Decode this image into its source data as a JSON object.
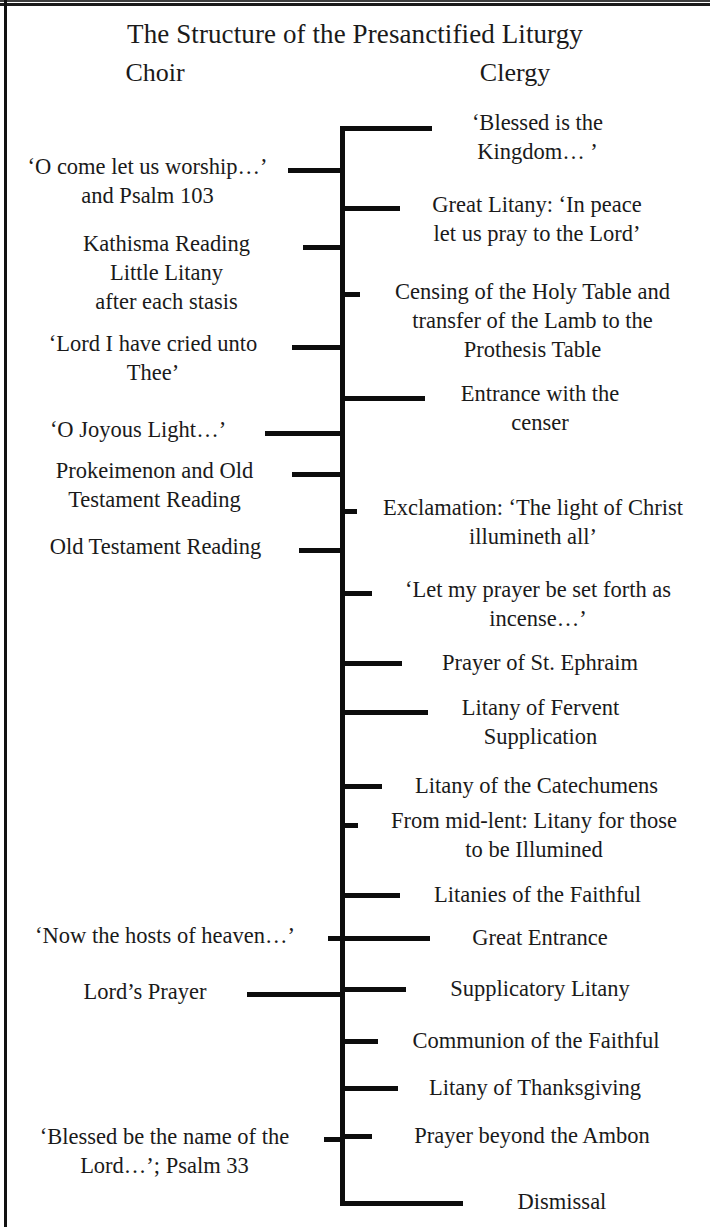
{
  "diagram": {
    "title": "The Structure of the Presanctified Liturgy",
    "columns": {
      "left_heading": "Choir",
      "right_heading": "Clergy"
    },
    "spine_color": "#0d0d0d",
    "background_color": "#ffffff",
    "text_color": "#1a1a1a"
  },
  "clergy_items": [
    {
      "text": "‘Blessed is the\nKingdom… ’"
    },
    {
      "text": "Great Litany: ‘In peace\nlet us pray to the Lord’"
    },
    {
      "text": "Censing of the Holy Table and\ntransfer of the Lamb to the\nProthesis Table"
    },
    {
      "text": "Entrance with the\ncenser"
    },
    {
      "text": "Exclamation: ‘The light of Christ\nillumineth all’"
    },
    {
      "text": "‘Let my prayer be set forth as\nincense…’"
    },
    {
      "text": "Prayer of St. Ephraim"
    },
    {
      "text": "Litany of Fervent\nSupplication"
    },
    {
      "text": "Litany of the Catechumens"
    },
    {
      "text": "From mid-lent: Litany for those\nto be Illumined"
    },
    {
      "text": "Litanies of the Faithful"
    },
    {
      "text": "Great Entrance"
    },
    {
      "text": "Supplicatory Litany"
    },
    {
      "text": "Communion of the Faithful"
    },
    {
      "text": "Litany of Thanksgiving"
    },
    {
      "text": "Prayer beyond the Ambon"
    },
    {
      "text": "Dismissal"
    }
  ],
  "choir_items": [
    {
      "text": "‘O come let us worship…’\nand Psalm 103"
    },
    {
      "text": "Kathisma Reading\nLittle Litany\nafter each stasis"
    },
    {
      "text": "‘Lord I have cried unto\nThee’"
    },
    {
      "text": "‘O Joyous Light…’"
    },
    {
      "text": "Prokeimenon and Old\nTestament Reading"
    },
    {
      "text": "Old Testament Reading"
    },
    {
      "text": "‘Now the hosts of heaven…’"
    },
    {
      "text": "Lord’s Prayer"
    },
    {
      "text": "‘Blessed be the name of the\nLord…’; Psalm 33"
    }
  ]
}
